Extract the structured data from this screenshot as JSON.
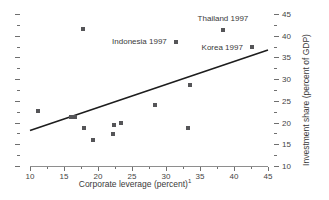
{
  "chart_data": {
    "type": "scatter",
    "title": "",
    "xlabel": "Corporate leverage (percent)",
    "xlabel_superscript": "1",
    "ylabel": "Investment share (percent of GDP)",
    "xlim": [
      10,
      45
    ],
    "ylim": [
      10,
      45
    ],
    "xticks": [
      10,
      15,
      20,
      25,
      30,
      35,
      40,
      45
    ],
    "yticks": [
      10,
      15,
      20,
      25,
      30,
      35,
      40,
      45
    ],
    "xtick_labels": [
      "10",
      "15",
      "20",
      "25",
      "30",
      "35",
      "40",
      "45"
    ],
    "ytick_labels": [
      "10",
      "15",
      "20",
      "25",
      "30",
      "35",
      "40",
      "45"
    ],
    "minor_tick_step": 2.5,
    "y_axis_position": "right",
    "left_axis_ticks_unlabeled": true,
    "grid": false,
    "legend": false,
    "marker": "square",
    "marker_color": "#555558",
    "points": [
      {
        "x": 11.2,
        "y": 22.7,
        "label": ""
      },
      {
        "x": 16.0,
        "y": 21.2,
        "label": ""
      },
      {
        "x": 16.6,
        "y": 21.3,
        "label": ""
      },
      {
        "x": 17.8,
        "y": 41.6,
        "label": ""
      },
      {
        "x": 17.9,
        "y": 18.7,
        "label": ""
      },
      {
        "x": 19.3,
        "y": 16.1,
        "label": ""
      },
      {
        "x": 22.2,
        "y": 17.4,
        "label": ""
      },
      {
        "x": 22.4,
        "y": 19.5,
        "label": ""
      },
      {
        "x": 23.4,
        "y": 20.0,
        "label": ""
      },
      {
        "x": 28.4,
        "y": 24.1,
        "label": ""
      },
      {
        "x": 31.5,
        "y": 38.6,
        "label": "Indonesia 1997"
      },
      {
        "x": 33.3,
        "y": 18.8,
        "label": ""
      },
      {
        "x": 33.6,
        "y": 28.6,
        "label": ""
      },
      {
        "x": 38.4,
        "y": 41.3,
        "label": "Thailand 1997"
      },
      {
        "x": 42.6,
        "y": 37.4,
        "label": "Korea 1997"
      }
    ],
    "annotations": [
      {
        "text": "Thailand 1997",
        "x": 38.4,
        "y": 43.9,
        "anchor": "above"
      },
      {
        "text": "Indonesia 1997",
        "x": 30.6,
        "y": 38.6,
        "anchor": "left"
      },
      {
        "text": "Korea 1997",
        "x": 41.7,
        "y": 37.4,
        "anchor": "left"
      }
    ],
    "trendline": {
      "type": "linear",
      "x_start": 10,
      "y_start": 18.2,
      "x_end": 45,
      "y_end": 36.7,
      "color": "#1d1d1d",
      "width": 1.6
    }
  }
}
